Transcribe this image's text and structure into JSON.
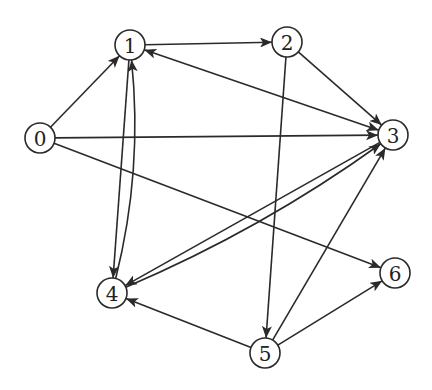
{
  "graph": {
    "type": "directed",
    "colors": {
      "stroke": "#2a2a2a",
      "node_fill": "#ffffff",
      "label": "#222222"
    },
    "node_radius": 15,
    "nodes": [
      {
        "id": "0",
        "label": "0",
        "x": 40,
        "y": 138
      },
      {
        "id": "1",
        "label": "1",
        "x": 130,
        "y": 45
      },
      {
        "id": "2",
        "label": "2",
        "x": 287,
        "y": 42
      },
      {
        "id": "3",
        "label": "3",
        "x": 393,
        "y": 135
      },
      {
        "id": "4",
        "label": "4",
        "x": 112,
        "y": 293
      },
      {
        "id": "5",
        "label": "5",
        "x": 265,
        "y": 353
      },
      {
        "id": "6",
        "label": "6",
        "x": 395,
        "y": 273
      }
    ],
    "edges": [
      {
        "from": "0",
        "to": "1"
      },
      {
        "from": "0",
        "to": "3"
      },
      {
        "from": "0",
        "to": "6"
      },
      {
        "from": "1",
        "to": "2"
      },
      {
        "from": "1",
        "to": "4"
      },
      {
        "from": "1",
        "to": "3",
        "bidirectional": true
      },
      {
        "from": "2",
        "to": "3"
      },
      {
        "from": "2",
        "to": "5"
      },
      {
        "from": "3",
        "to": "4"
      },
      {
        "from": "4",
        "to": "3",
        "curve": 18
      },
      {
        "from": "4",
        "to": "1",
        "curve": 22
      },
      {
        "from": "5",
        "to": "4"
      },
      {
        "from": "5",
        "to": "3"
      },
      {
        "from": "5",
        "to": "6"
      }
    ]
  }
}
